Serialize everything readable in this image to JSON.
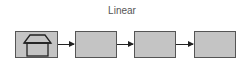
{
  "diagram": {
    "title": "Linear",
    "nodes": [
      {
        "id": "node-1",
        "icon": "house-icon"
      },
      {
        "id": "node-2"
      },
      {
        "id": "node-3"
      },
      {
        "id": "node-4"
      }
    ],
    "edges": [
      {
        "from": "node-1",
        "to": "node-2"
      },
      {
        "from": "node-2",
        "to": "node-3"
      },
      {
        "from": "node-3",
        "to": "node-4"
      }
    ],
    "colors": {
      "box_fill": "#c4c4c4",
      "box_border": "#555555",
      "arrow": "#222222"
    }
  }
}
